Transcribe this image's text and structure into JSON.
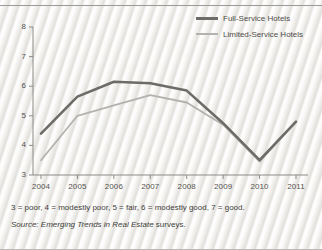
{
  "chart_data": {
    "type": "line",
    "title": "",
    "xlabel": "",
    "ylabel": "",
    "x": [
      2004,
      2005,
      2006,
      2007,
      2008,
      2009,
      2010,
      2011
    ],
    "categories": [
      "2004",
      "2005",
      "2006",
      "2007",
      "2008",
      "2009",
      "2010",
      "2011"
    ],
    "ylim": [
      3,
      8
    ],
    "yticks": [
      3,
      4,
      5,
      6,
      7,
      8
    ],
    "ytick_labels": [
      "3",
      "4",
      "5",
      "6",
      "7",
      "8"
    ],
    "grid": false,
    "legend_position": "top-right",
    "series": [
      {
        "name": "Full-Service Hotels",
        "color": "#6e6c69",
        "width": 2.6,
        "values": [
          4.4,
          5.65,
          6.15,
          6.1,
          5.85,
          4.75,
          3.5,
          4.8
        ]
      },
      {
        "name": "Limited-Service Hotels",
        "color": "#b3b2ae",
        "width": 1.8,
        "values": [
          3.5,
          5.0,
          5.35,
          5.7,
          5.45,
          4.7,
          3.45,
          4.8
        ]
      }
    ]
  },
  "legend": {
    "items": [
      {
        "label": "Full-Service Hotels"
      },
      {
        "label": "Limited-Service Hotels"
      }
    ]
  },
  "footnotes": {
    "scale": "3 = poor, 4 = modestly poor, 5 = fair, 6 = modestly good, 7 = good.",
    "source_label": "Source:",
    "source_title": "Emerging Trends in Real Estate",
    "source_suffix": "surveys."
  },
  "colors": {
    "full_service": "#6e6c69",
    "limited_service": "#b3b2ae",
    "axis": "#8d8b87",
    "text": "#44423f",
    "background": "#f2f1ef"
  }
}
